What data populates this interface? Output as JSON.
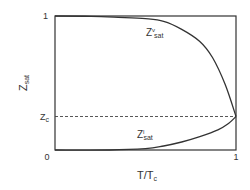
{
  "chart_data": {
    "type": "line",
    "title": "",
    "xlabel": "T/T_c",
    "ylabel": "Z_sat",
    "xlim": [
      0,
      1
    ],
    "ylim": [
      0,
      1
    ],
    "grid": false,
    "legend": "none",
    "x_ticks": [
      "0",
      "1"
    ],
    "y_ticks": [
      "1",
      "Z_c"
    ],
    "reference_lines": [
      {
        "label": "Z_c",
        "y": 0.25,
        "style": "dashed"
      }
    ],
    "series": [
      {
        "name": "Z^v_sat",
        "label_main": "Z",
        "label_sup": "v",
        "label_sub": "sat",
        "x": [
          0.0,
          0.2,
          0.35,
          0.5,
          0.6,
          0.7,
          0.8,
          0.87,
          0.94,
          1.0
        ],
        "y": [
          1.0,
          0.998,
          0.99,
          0.98,
          0.96,
          0.9,
          0.81,
          0.69,
          0.49,
          0.25
        ]
      },
      {
        "name": "Z^l_sat",
        "label_main": "Z",
        "label_sup": "l",
        "label_sub": "sat",
        "x": [
          0.0,
          0.3,
          0.5,
          0.6,
          0.7,
          0.8,
          0.9,
          0.96,
          1.0
        ],
        "y": [
          0.0,
          0.0,
          0.01,
          0.03,
          0.06,
          0.1,
          0.15,
          0.2,
          0.25
        ]
      }
    ]
  },
  "labels": {
    "y_axis_main": "Z",
    "y_axis_sub": "sat",
    "x_axis_main": "T/T",
    "x_axis_sub": "c",
    "tick_y_top": "1",
    "tick_y_zc_main": "Z",
    "tick_y_zc_sub": "c",
    "tick_x_left": "0",
    "tick_x_right": "1",
    "vapor_main": "Z",
    "vapor_sup": "v",
    "vapor_sub": "sat",
    "liquid_main": "Z",
    "liquid_sup": "l",
    "liquid_sub": "sat"
  }
}
